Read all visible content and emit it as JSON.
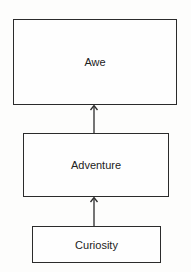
{
  "diagram": {
    "type": "flow",
    "nodes": [
      {
        "id": "awe",
        "label": "Awe"
      },
      {
        "id": "adventure",
        "label": "Adventure"
      },
      {
        "id": "curiosity",
        "label": "Curiosity"
      }
    ],
    "edges": [
      {
        "from": "curiosity",
        "to": "adventure"
      },
      {
        "from": "adventure",
        "to": "awe"
      }
    ]
  }
}
